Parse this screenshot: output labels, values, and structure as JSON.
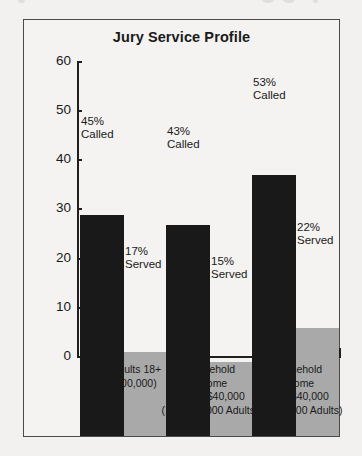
{
  "chart_data": {
    "type": "bar",
    "title": "Jury Service Profile",
    "xlabel": "",
    "ylabel": "",
    "ylim": [
      0,
      60
    ],
    "yticks": [
      0,
      10,
      20,
      30,
      40,
      50,
      60
    ],
    "grid": false,
    "legend": "none",
    "categories": [
      "Total Adults 18+ (186,000,000)",
      "Household Income Under $40,000 (130,000,000 Adults)",
      "Household Income Over $40,000 (56,000,000 Adults)"
    ],
    "series": [
      {
        "name": "Called",
        "values": [
          45,
          43,
          53
        ]
      },
      {
        "name": "Served",
        "values": [
          17,
          15,
          22
        ]
      }
    ],
    "annotations": [
      "45% Called",
      "17% Served",
      "43% Called",
      "15% Served",
      "53% Called",
      "22% Served"
    ]
  },
  "axis": {
    "ticks": [
      {
        "label": "60",
        "value": 60
      },
      {
        "label": "50",
        "value": 50
      },
      {
        "label": "40",
        "value": 40
      },
      {
        "label": "30",
        "value": 30
      },
      {
        "label": "20",
        "value": 20
      },
      {
        "label": "10",
        "value": 10
      },
      {
        "label": "0",
        "value": 0
      }
    ]
  },
  "groups": [
    {
      "called_pct": "45%",
      "called_word": "Called",
      "served_pct": "17%",
      "served_word": "Served",
      "cat_line1": "Total Adults 18+",
      "cat_line2": "(186,000,000)",
      "cat_line3": "",
      "cat_line4": ""
    },
    {
      "called_pct": "43%",
      "called_word": "Called",
      "served_pct": "15%",
      "served_word": "Served",
      "cat_line1": "Household",
      "cat_line2": "Income",
      "cat_line3": "Under $40,000",
      "cat_line4": "(130,000,000 Adults)"
    },
    {
      "called_pct": "53%",
      "called_word": "Called",
      "served_pct": "22%",
      "served_word": "Served",
      "cat_line1": "Household",
      "cat_line2": "Income",
      "cat_line3": "Over $40,000",
      "cat_line4": "(56,000,000 Adults)"
    }
  ],
  "colors": {
    "called_bar": "#191919",
    "served_bar": "#a9a9a9",
    "frame": "#4a4a4a",
    "background": "#f4f3f1",
    "text": "#1a1a1a"
  }
}
